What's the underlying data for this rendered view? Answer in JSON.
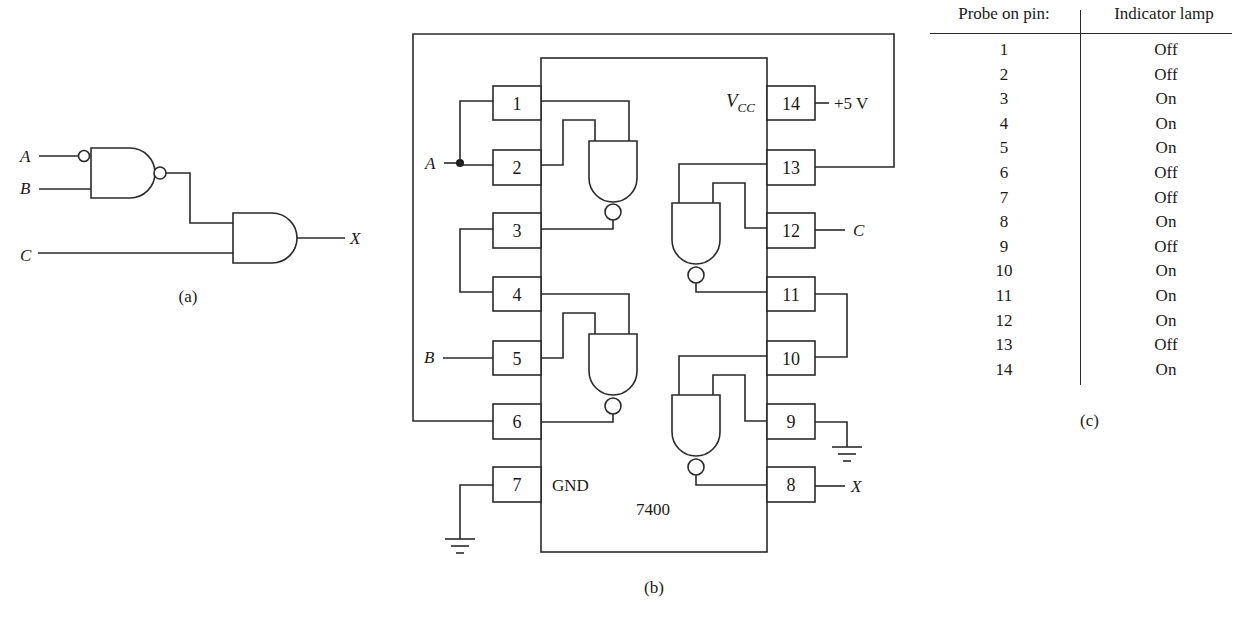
{
  "figure_a": {
    "caption": "(a)",
    "inputs": [
      "A",
      "B",
      "C"
    ],
    "output": "X",
    "gates": [
      {
        "type": "NAND",
        "inputs": [
          "A (inverted bubble)",
          "B"
        ],
        "note": "input bubble on A, output bubble"
      },
      {
        "type": "AND",
        "inputs": [
          "NAND output",
          "C"
        ],
        "output": "X"
      }
    ]
  },
  "figure_b": {
    "caption": "(b)",
    "chip_label": "7400",
    "vcc_label": "V",
    "vcc_sub": "CC",
    "gnd_label": "GND",
    "supply_label": "+5 V",
    "signals": {
      "a": "A",
      "b": "B",
      "c": "C",
      "x": "X"
    },
    "left_pins": [
      "1",
      "2",
      "3",
      "4",
      "5",
      "6",
      "7"
    ],
    "right_pins": [
      "14",
      "13",
      "12",
      "11",
      "10",
      "9",
      "8"
    ]
  },
  "figure_c": {
    "caption": "(c)",
    "headers": {
      "pin": "Probe on pin:",
      "lamp": "Indicator lamp"
    },
    "rows": [
      {
        "pin": "1",
        "lamp": "Off"
      },
      {
        "pin": "2",
        "lamp": "Off"
      },
      {
        "pin": "3",
        "lamp": "On"
      },
      {
        "pin": "4",
        "lamp": "On"
      },
      {
        "pin": "5",
        "lamp": "On"
      },
      {
        "pin": "6",
        "lamp": "Off"
      },
      {
        "pin": "7",
        "lamp": "Off"
      },
      {
        "pin": "8",
        "lamp": "On"
      },
      {
        "pin": "9",
        "lamp": "Off"
      },
      {
        "pin": "10",
        "lamp": "On"
      },
      {
        "pin": "11",
        "lamp": "On"
      },
      {
        "pin": "12",
        "lamp": "On"
      },
      {
        "pin": "13",
        "lamp": "Off"
      },
      {
        "pin": "14",
        "lamp": "On"
      }
    ]
  }
}
